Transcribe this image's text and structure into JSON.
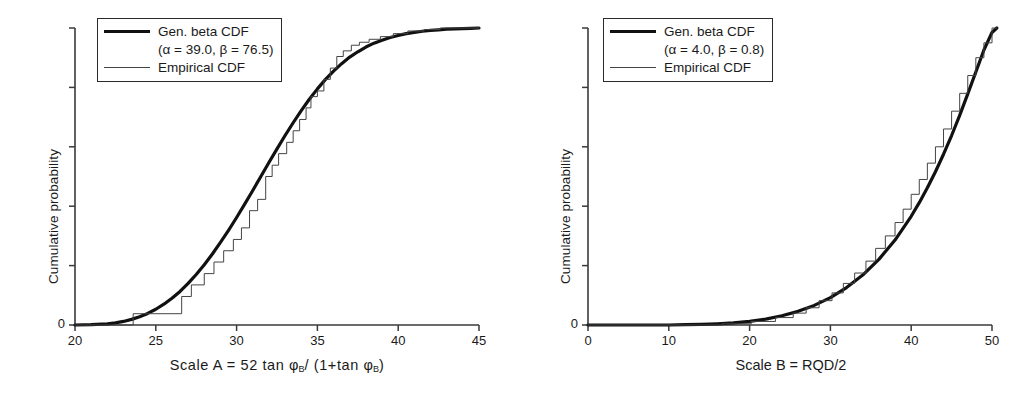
{
  "figure": {
    "panels": [
      {
        "id": "left",
        "ylabel": "Cumulative probability",
        "xlabel_text": "Scale A = 52 tan φB/ (1+tan φB)",
        "legend": {
          "entry1_line1": "Gen. beta CDF",
          "entry1_line2": "(α = 39.0, β = 76.5)",
          "entry2": "Empirical CDF"
        },
        "xticks": [
          "20",
          "25",
          "30",
          "35",
          "40",
          "45"
        ],
        "yticks": [
          "0",
          "",
          "",
          "",
          "",
          ""
        ]
      },
      {
        "id": "right",
        "ylabel": "Cumulative probability",
        "xlabel_text": "Scale B = RQD/2",
        "legend": {
          "entry1_line1": "Gen. beta CDF",
          "entry1_line2": "(α = 4.0, β = 0.8)",
          "entry2": "Empirical CDF"
        },
        "xticks": [
          "0",
          "10",
          "20",
          "30",
          "40",
          "50"
        ],
        "yticks": [
          "0",
          "",
          "",
          "",
          "",
          ""
        ]
      }
    ]
  },
  "colors": {
    "fit_curve": "#111111",
    "empirical_curve": "#444444",
    "axis": "#3a3a3a",
    "background": "#ffffff"
  },
  "chart_data": [
    {
      "type": "line",
      "title": "",
      "panel": "left",
      "xlabel": "Scale A = 52 tan φB/ (1+tan φB)",
      "ylabel": "Cumulative probability",
      "xlim": [
        20,
        45
      ],
      "ylim": [
        0,
        1
      ],
      "xticks": [
        20,
        25,
        30,
        35,
        40,
        45
      ],
      "yticks": [
        0,
        0.2,
        0.4,
        0.6,
        0.8,
        1.0
      ],
      "ytick_labels": [
        "0",
        "",
        "",
        "",
        "",
        ""
      ],
      "grid": false,
      "legend_position": "upper-left",
      "params": {
        "alpha": 39.0,
        "beta": 76.5
      },
      "series": [
        {
          "name": "Gen. beta CDF (α = 39.0, β = 76.5)",
          "style": "thick-smooth",
          "x": [
            20.0,
            21.0,
            22.0,
            22.5,
            23.0,
            23.5,
            24.0,
            24.5,
            25.0,
            25.5,
            26.0,
            26.5,
            27.0,
            27.5,
            28.0,
            28.5,
            29.0,
            29.5,
            30.0,
            30.5,
            31.0,
            31.5,
            32.0,
            32.5,
            33.0,
            33.5,
            34.0,
            34.5,
            35.0,
            35.5,
            36.0,
            36.5,
            37.0,
            37.5,
            38.0,
            38.5,
            39.0,
            39.5,
            40.0,
            40.5,
            41.0,
            41.5,
            42.0,
            42.5,
            43.0,
            43.5,
            44.0,
            44.5,
            45.0
          ],
          "y": [
            0.0,
            0.001,
            0.004,
            0.007,
            0.012,
            0.019,
            0.028,
            0.039,
            0.053,
            0.07,
            0.09,
            0.113,
            0.14,
            0.17,
            0.203,
            0.239,
            0.278,
            0.319,
            0.362,
            0.407,
            0.453,
            0.5,
            0.547,
            0.593,
            0.638,
            0.681,
            0.722,
            0.76,
            0.795,
            0.827,
            0.855,
            0.88,
            0.902,
            0.92,
            0.936,
            0.949,
            0.959,
            0.968,
            0.975,
            0.981,
            0.985,
            0.989,
            0.992,
            0.994,
            0.996,
            0.997,
            0.998,
            0.999,
            1.0
          ]
        },
        {
          "name": "Empirical CDF",
          "style": "thin-step",
          "x": [
            20.0,
            23.6,
            23.6,
            24.9,
            24.9,
            26.6,
            26.6,
            27.2,
            27.2,
            28.0,
            28.0,
            28.6,
            28.6,
            29.2,
            29.2,
            29.8,
            29.8,
            30.3,
            30.3,
            30.8,
            30.8,
            31.3,
            31.3,
            31.8,
            31.8,
            32.2,
            32.2,
            32.6,
            32.6,
            33.1,
            33.1,
            33.5,
            33.5,
            33.9,
            33.9,
            34.3,
            34.3,
            34.6,
            34.6,
            35.0,
            35.0,
            35.4,
            35.4,
            35.8,
            35.8,
            36.2,
            36.2,
            36.6,
            36.6,
            37.1,
            37.1,
            37.6,
            37.6,
            38.2,
            38.2,
            38.9,
            38.9,
            39.7,
            39.7,
            40.6,
            40.6,
            41.6,
            41.6,
            42.6,
            42.6,
            43.6,
            43.6,
            44.4,
            44.4,
            45.0
          ],
          "y": [
            0.0,
            0.0,
            0.038,
            0.038,
            0.038,
            0.038,
            0.096,
            0.096,
            0.135,
            0.135,
            0.173,
            0.173,
            0.212,
            0.212,
            0.25,
            0.25,
            0.288,
            0.288,
            0.327,
            0.327,
            0.385,
            0.385,
            0.423,
            0.423,
            0.5,
            0.5,
            0.538,
            0.538,
            0.577,
            0.577,
            0.615,
            0.615,
            0.654,
            0.654,
            0.692,
            0.692,
            0.731,
            0.731,
            0.769,
            0.769,
            0.788,
            0.788,
            0.827,
            0.827,
            0.865,
            0.865,
            0.904,
            0.904,
            0.923,
            0.923,
            0.942,
            0.942,
            0.952,
            0.952,
            0.962,
            0.962,
            0.971,
            0.971,
            0.981,
            0.981,
            0.99,
            0.99,
            0.995,
            0.995,
            1.0,
            1.0,
            1.0,
            1.0,
            1.0,
            1.0
          ]
        }
      ]
    },
    {
      "type": "line",
      "title": "",
      "panel": "right",
      "xlabel": "Scale B = RQD/2",
      "ylabel": "Cumulative probability",
      "xlim": [
        0,
        50
      ],
      "ylim": [
        0,
        1
      ],
      "xticks": [
        0,
        10,
        20,
        30,
        40,
        50
      ],
      "yticks": [
        0,
        0.2,
        0.4,
        0.6,
        0.8,
        1.0
      ],
      "ytick_labels": [
        "0",
        "",
        "",
        "",
        "",
        ""
      ],
      "grid": false,
      "legend_position": "upper-left",
      "params": {
        "alpha": 4.0,
        "beta": 0.8
      },
      "series": [
        {
          "name": "Gen. beta CDF (α = 4.0, β = 0.8)",
          "style": "thick-smooth",
          "x": [
            0,
            2,
            4,
            6,
            8,
            10,
            12,
            14,
            16,
            18,
            20,
            22,
            24,
            26,
            28,
            30,
            32,
            34,
            36,
            38,
            40,
            41,
            42,
            43,
            44,
            45,
            46,
            47,
            48,
            49,
            50,
            50.6
          ],
          "y": [
            0.0,
            0.0,
            0.0,
            0.0,
            0.0,
            0.0,
            0.001,
            0.002,
            0.004,
            0.007,
            0.012,
            0.02,
            0.031,
            0.046,
            0.066,
            0.092,
            0.126,
            0.168,
            0.221,
            0.286,
            0.366,
            0.412,
            0.462,
            0.516,
            0.575,
            0.638,
            0.706,
            0.778,
            0.852,
            0.926,
            0.985,
            1.0
          ]
        },
        {
          "name": "Empirical CDF",
          "style": "thin-step",
          "x": [
            0,
            16.6,
            16.6,
            20.2,
            20.2,
            23.2,
            23.2,
            25.4,
            25.4,
            27.0,
            27.0,
            28.6,
            28.6,
            30.2,
            30.2,
            31.6,
            31.6,
            33.0,
            33.0,
            34.4,
            34.4,
            35.6,
            35.6,
            36.8,
            36.8,
            38.0,
            38.0,
            39.0,
            39.0,
            40.0,
            40.0,
            41.0,
            41.0,
            42.0,
            42.0,
            43.0,
            43.0,
            44.0,
            44.0,
            45.0,
            45.0,
            46.0,
            46.0,
            47.0,
            47.0,
            48.0,
            48.0,
            49.0,
            49.0,
            50.0,
            50.0,
            50.6
          ],
          "y": [
            0.0,
            0.0,
            0.004,
            0.004,
            0.012,
            0.012,
            0.025,
            0.025,
            0.04,
            0.04,
            0.058,
            0.058,
            0.082,
            0.082,
            0.108,
            0.108,
            0.14,
            0.14,
            0.175,
            0.175,
            0.215,
            0.215,
            0.258,
            0.258,
            0.3,
            0.3,
            0.345,
            0.345,
            0.39,
            0.39,
            0.44,
            0.44,
            0.49,
            0.49,
            0.545,
            0.545,
            0.6,
            0.6,
            0.66,
            0.66,
            0.72,
            0.72,
            0.78,
            0.78,
            0.84,
            0.84,
            0.9,
            0.9,
            0.95,
            0.95,
            1.0,
            1.0
          ]
        }
      ]
    }
  ]
}
